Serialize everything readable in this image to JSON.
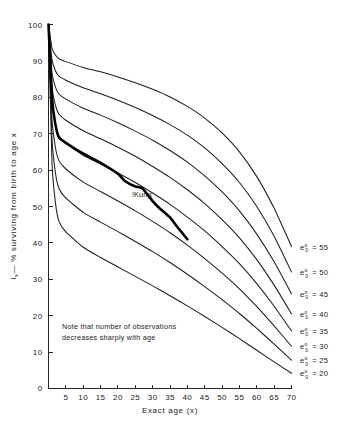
{
  "figure": {
    "background": "#ffffff",
    "ink_color": "#1a1a1a"
  },
  "annotations": {
    "kung_label": "!Kung",
    "note_line1": "Note that number of observations",
    "note_line2": "decreases sharply with age"
  },
  "axes": {
    "x_title": "Exact age (x)",
    "y_title": "lₓ — % surviving from birth to age x",
    "y_title_symbol": "l",
    "y_title_subscript": "x",
    "y_title_rest": "— % surviving from birth to age x",
    "x_ticks": [
      "0",
      "5",
      "10",
      "15",
      "20",
      "25",
      "30",
      "35",
      "40",
      "45",
      "50",
      "55",
      "60",
      "65",
      "70"
    ],
    "y_ticks": [
      "0",
      "10",
      "20",
      "30",
      "40",
      "50",
      "60",
      "70",
      "80",
      "90",
      "100"
    ]
  },
  "legend": {
    "items": [
      {
        "label": "e°₀ = 55",
        "value": 55,
        "base": "e",
        "sup": "o",
        "sub": "0",
        "eq": "= 55"
      },
      {
        "label": "e°₀ = 50",
        "value": 50,
        "base": "e",
        "sup": "o",
        "sub": "0",
        "eq": "= 50"
      },
      {
        "label": "e°₀ = 45",
        "value": 45,
        "base": "e",
        "sup": "o",
        "sub": "0",
        "eq": "= 45"
      },
      {
        "label": "e°₀ = 40",
        "value": 40,
        "base": "e",
        "sup": "o",
        "sub": "0",
        "eq": "= 40"
      },
      {
        "label": "e°₀ = 35",
        "value": 35,
        "base": "e",
        "sup": "o",
        "sub": "0",
        "eq": "= 35"
      },
      {
        "label": "e°₀ = 30",
        "value": 30,
        "base": "e",
        "sup": "o",
        "sub": "0",
        "eq": "= 30"
      },
      {
        "label": "e°₀ = 25",
        "value": 25,
        "base": "e",
        "sup": "o",
        "sub": "0",
        "eq": "= 25"
      },
      {
        "label": "e°₀ = 20",
        "value": 20,
        "base": "e",
        "sup": "o",
        "sub": "0",
        "eq": "= 20"
      }
    ]
  },
  "chart_data": {
    "type": "line",
    "title": "",
    "subtitle": "",
    "xlabel": "Exact age (x)",
    "ylabel": "lₓ — % surviving from birth to age x",
    "xlim": [
      0,
      70
    ],
    "ylim": [
      0,
      100
    ],
    "x_tick_step": 5,
    "y_tick_step": 10,
    "grid": false,
    "legend_position": "right-margin-inline",
    "x": [
      0,
      1,
      2,
      3,
      5,
      10,
      15,
      20,
      25,
      30,
      35,
      40,
      45,
      50,
      55,
      60,
      65,
      70
    ],
    "series": [
      {
        "name": "e°₀ = 55",
        "label": "e°₀ = 55",
        "style": "thin",
        "values": [
          100,
          93.5,
          91.6,
          90.6,
          89.8,
          88.2,
          87.0,
          85.6,
          84.0,
          82.2,
          80.1,
          77.5,
          74.3,
          70.2,
          65.0,
          58.2,
          49.5,
          39.0
        ]
      },
      {
        "name": "e°₀ = 50",
        "label": "e°₀ = 50",
        "style": "thin",
        "values": [
          100,
          90.3,
          87.3,
          85.8,
          84.7,
          82.6,
          81.0,
          79.2,
          77.2,
          75.0,
          72.5,
          69.6,
          66.1,
          61.8,
          56.6,
          50.0,
          41.8,
          32.0
        ]
      },
      {
        "name": "e°₀ = 45",
        "label": "e°₀ = 45",
        "style": "thin",
        "values": [
          100,
          86.8,
          82.8,
          80.9,
          79.5,
          77.0,
          75.1,
          73.0,
          70.7,
          68.2,
          65.4,
          62.2,
          58.4,
          54.0,
          48.8,
          42.4,
          34.8,
          26.0
        ]
      },
      {
        "name": "e°₀ = 40",
        "label": "e°₀ = 40",
        "style": "thin",
        "values": [
          100,
          83.0,
          77.8,
          75.4,
          73.7,
          70.8,
          68.6,
          66.3,
          63.8,
          61.0,
          58.0,
          54.6,
          50.8,
          46.4,
          41.4,
          35.4,
          28.4,
          20.5
        ]
      },
      {
        "name": "e°₀ = 35",
        "label": "e°₀ = 35",
        "style": "thin",
        "values": [
          100,
          78.8,
          72.4,
          69.4,
          67.4,
          64.1,
          61.7,
          59.2,
          56.6,
          53.7,
          50.6,
          47.1,
          43.3,
          39.0,
          34.3,
          28.8,
          22.6,
          15.8
        ]
      },
      {
        "name": "e°₀ = 30",
        "label": "e°₀ = 30",
        "style": "thin",
        "values": [
          100,
          74.0,
          66.2,
          62.6,
          60.3,
          56.7,
          54.1,
          51.5,
          48.8,
          45.9,
          42.8,
          39.4,
          35.7,
          31.7,
          27.4,
          22.5,
          17.2,
          11.6
        ]
      },
      {
        "name": "e°₀ = 25",
        "label": "e°₀ = 25",
        "style": "thin",
        "values": [
          100,
          68.6,
          59.2,
          55.0,
          52.3,
          48.4,
          45.7,
          43.1,
          40.4,
          37.6,
          34.6,
          31.4,
          28.0,
          24.4,
          20.6,
          16.5,
          12.2,
          7.8
        ]
      },
      {
        "name": "e°₀ = 20",
        "label": "e°₀ = 20",
        "style": "thin",
        "values": [
          100,
          62.0,
          51.0,
          46.0,
          43.0,
          38.8,
          36.0,
          33.4,
          30.8,
          28.2,
          25.5,
          22.7,
          19.8,
          16.8,
          13.7,
          10.5,
          7.3,
          4.2
        ]
      },
      {
        "name": "!Kung",
        "label": "!Kung",
        "style": "bold",
        "x": [
          0,
          1,
          2,
          3,
          5,
          10,
          15,
          20,
          22,
          25,
          27,
          30,
          32,
          35,
          37,
          40
        ],
        "values": [
          100,
          80.0,
          72.5,
          69.0,
          67.5,
          64.5,
          62.0,
          59.0,
          57.0,
          55.5,
          55.0,
          51.5,
          49.5,
          47.0,
          44.5,
          41.0
        ]
      }
    ]
  }
}
